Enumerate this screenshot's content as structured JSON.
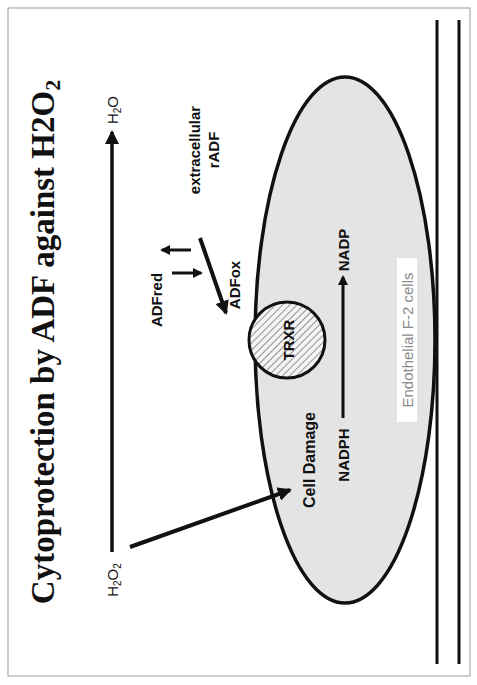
{
  "title": "Cytoprotection by ADF against H2O2",
  "title_parts": {
    "main": "Cytoprotection by ADF against H2O",
    "sub": "2"
  },
  "labels": {
    "h2o2_main": "H2O",
    "h2o2_sub": "2",
    "h2o_main": "H",
    "h2o_sub": "2",
    "h2o_tail": "O",
    "adf_red": "ADFred",
    "adf_ox": "ADFox",
    "extracellular_line1": "extracellular",
    "extracellular_line2": "rADF",
    "trxr": "TRXR",
    "cell_damage": "Cell Damage",
    "nadph": "NADPH",
    "nadp": "NADP",
    "cell_type": "Endothelial F-2 cells"
  },
  "colors": {
    "ink": "#111111",
    "cell_fill": "#e4e4e4",
    "background": "#ffffff",
    "border": "#9a9a9a",
    "cell_label": "#8a8a8a"
  },
  "orientation": "rotated 90° counter-clockwise"
}
